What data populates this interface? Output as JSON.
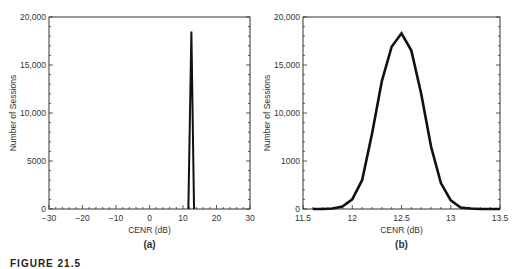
{
  "figure": {
    "caption": "FIGURE 21.5"
  },
  "chart_data": [
    {
      "type": "line",
      "panel_label": "(a)",
      "title": "",
      "xlabel": "CENR (dB)",
      "ylabel": "Number of Sessions",
      "xlim": [
        -30,
        30
      ],
      "ylim": [
        0,
        20000
      ],
      "xticks": [
        -30,
        -20,
        -10,
        0,
        10,
        20,
        30
      ],
      "xtick_labels": [
        "−30",
        "−20",
        "−10",
        "0",
        "10",
        "20",
        "30"
      ],
      "yticks": [
        0,
        5000,
        10000,
        15000,
        20000
      ],
      "ytick_labels": [
        "0",
        "5000",
        "10,000",
        "15,000",
        "20,000"
      ],
      "grid": false,
      "series": [
        {
          "name": "CENR distribution",
          "x": [
            11.6,
            12.5,
            13.3
          ],
          "y": [
            0,
            18500,
            0
          ]
        }
      ]
    },
    {
      "type": "line",
      "panel_label": "(b)",
      "title": "",
      "xlabel": "CENR (dB)",
      "ylabel": "Number of Sessions",
      "xlim": [
        11.5,
        13.5
      ],
      "ylim": [
        0,
        20000
      ],
      "xticks": [
        11.5,
        12,
        12.5,
        13,
        13.5
      ],
      "xtick_labels": [
        "11.5",
        "12",
        "12.5",
        "13",
        "13.5"
      ],
      "yticks": [
        0,
        5000,
        10000,
        15000,
        20000
      ],
      "ytick_labels": [
        "0",
        "1000",
        "10,000",
        "15,000",
        "20,000"
      ],
      "grid": false,
      "series": [
        {
          "name": "CENR distribution (zoomed)",
          "x": [
            11.6,
            11.7,
            11.8,
            11.9,
            12.0,
            12.1,
            12.2,
            12.3,
            12.4,
            12.5,
            12.6,
            12.7,
            12.8,
            12.9,
            13.0,
            13.1,
            13.2,
            13.3,
            13.4,
            13.5
          ],
          "y": [
            0,
            0,
            50,
            250,
            1000,
            3000,
            7800,
            13300,
            16900,
            18300,
            16500,
            12000,
            6500,
            2700,
            900,
            150,
            50,
            0,
            0,
            0
          ]
        }
      ]
    }
  ]
}
